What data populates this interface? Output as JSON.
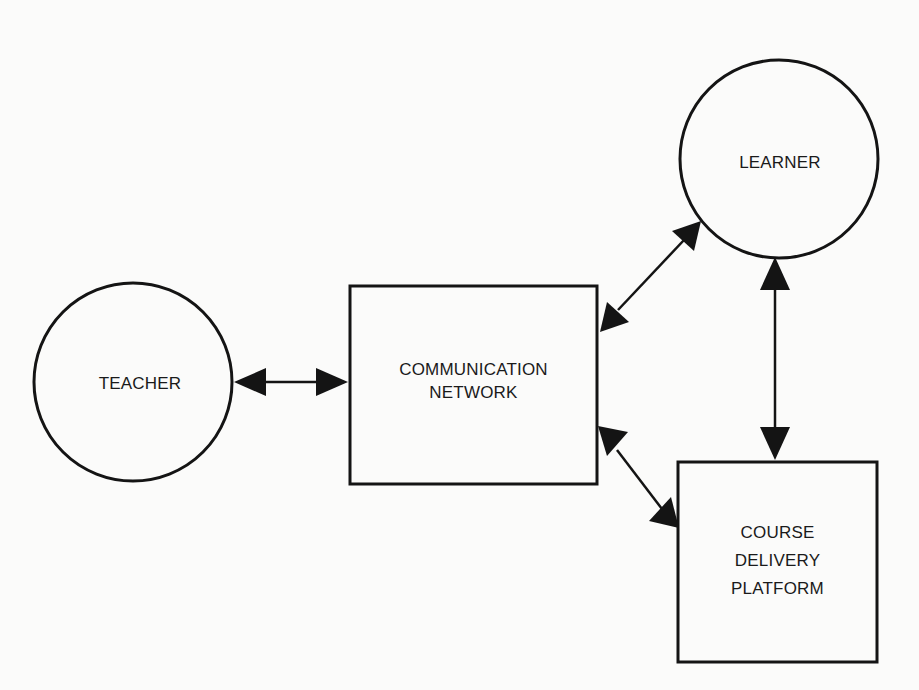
{
  "diagram": {
    "type": "block-diagram",
    "nodes": [
      {
        "id": "teacher",
        "shape": "circle",
        "label_lines": [
          "TEACHER"
        ]
      },
      {
        "id": "communication_network",
        "shape": "rectangle",
        "label_lines": [
          "COMMUNICATION",
          "NETWORK"
        ]
      },
      {
        "id": "learner",
        "shape": "circle",
        "label_lines": [
          "LEARNER"
        ]
      },
      {
        "id": "course_delivery_platform",
        "shape": "rectangle",
        "label_lines": [
          "COURSE",
          "DELIVERY",
          "PLATFORM"
        ]
      }
    ],
    "edges": [
      {
        "from": "teacher",
        "to": "communication_network",
        "direction": "bidirectional"
      },
      {
        "from": "communication_network",
        "to": "learner",
        "direction": "bidirectional"
      },
      {
        "from": "learner",
        "to": "course_delivery_platform",
        "direction": "bidirectional"
      },
      {
        "from": "communication_network",
        "to": "course_delivery_platform",
        "direction": "bidirectional"
      }
    ],
    "colors": {
      "stroke": "#141414",
      "background": "#fbfbfa",
      "text": "#1a1a1a"
    }
  }
}
